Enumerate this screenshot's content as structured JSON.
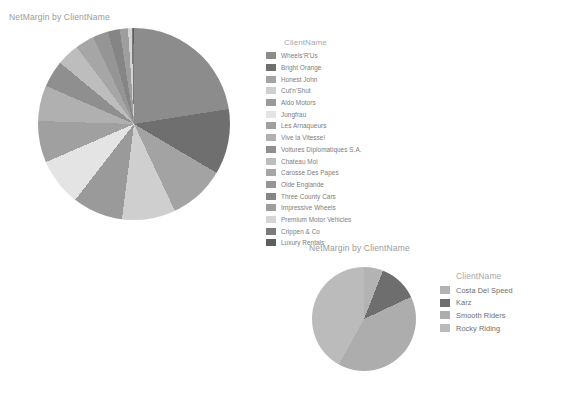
{
  "charts": [
    {
      "id": "chart-1",
      "title": "NetMargin by ClientName",
      "legend_title": "ClientName",
      "chart_data": {
        "type": "pie",
        "title": "NetMargin by ClientName",
        "xlabel": "",
        "ylabel": "NetMargin",
        "legend_title": "ClientName",
        "legend_position": "right",
        "grid": false,
        "categories": [
          "Wheels'R'Us",
          "Bright Orange",
          "Honest John",
          "Cut'n'Shut",
          "Aldo Motors",
          "Jungfrau",
          "Les Arnaqueurs",
          "Vive la Vitesse!",
          "Voitures Diplomatiques S.A.",
          "Chateau Moi",
          "Carosse Des Papes",
          "Olde Englande",
          "Three County Cars",
          "Impressive Wheels",
          "Premium Motor Vehicles",
          "Crippen & Co",
          "Luxury Rentals"
        ],
        "values": [
          22.5,
          11.0,
          9.5,
          9.0,
          8.5,
          8.0,
          7.0,
          6.0,
          4.5,
          3.8,
          3.2,
          2.6,
          2.0,
          1.4,
          0.6,
          0.3,
          0.1
        ],
        "colors": [
          "#8c8c8c",
          "#6f6f6f",
          "#a3a3a3",
          "#cfcfcf",
          "#9a9a9a",
          "#e4e4e4",
          "#a0a0a0",
          "#b0b0b0",
          "#8f8f8f",
          "#bdbdbd",
          "#a6a6a6",
          "#959595",
          "#858585",
          "#9e9e9e",
          "#d4d4d4",
          "#7a7a7a",
          "#5e5e5e"
        ]
      }
    },
    {
      "id": "chart-2",
      "title": "NetMargin by ClientName",
      "legend_title": "ClientName",
      "chart_data": {
        "type": "pie",
        "title": "NetMargin by ClientName",
        "xlabel": "",
        "ylabel": "NetMargin",
        "legend_title": "ClientName",
        "legend_position": "right",
        "grid": false,
        "categories": [
          "Costa Del Speed",
          "Karz",
          "Smooth Riders",
          "Rocky Riding"
        ],
        "values": [
          6.0,
          12.0,
          40.0,
          42.0
        ],
        "colors": [
          "#b3b3b3",
          "#6e6e6e",
          "#adadad",
          "#bbbbbb"
        ]
      }
    }
  ]
}
